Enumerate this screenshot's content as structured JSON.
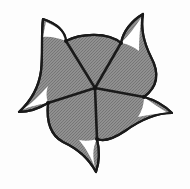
{
  "figure": {
    "type": "geometric-diagram",
    "background_color": "#fdfdfd",
    "fill_color": "#8a8a8a",
    "fill_pattern": "dithered-halftone",
    "outline_color": "#1a1a1a",
    "outline_width": 2.2,
    "spoke_color": "#1a1a1a",
    "spoke_width": 2.6,
    "highlight_color": "#ffffff",
    "symmetry_order": 5,
    "center": {
      "x": 95,
      "y": 88
    },
    "canvas": {
      "width": 190,
      "height": 189
    },
    "vertices": [
      {
        "name": "node-top-left",
        "x": 66,
        "y": 41
      },
      {
        "name": "node-top-right",
        "x": 121,
        "y": 43
      },
      {
        "name": "node-right",
        "x": 144,
        "y": 97
      },
      {
        "name": "node-bottom",
        "x": 97,
        "y": 139
      },
      {
        "name": "node-left",
        "x": 48,
        "y": 103
      }
    ],
    "horn_tips": [
      {
        "name": "horn-tip-top-left",
        "x": 43,
        "y": 19
      },
      {
        "name": "horn-tip-top-right",
        "x": 143,
        "y": 14
      },
      {
        "name": "horn-tip-right",
        "x": 172,
        "y": 113
      },
      {
        "name": "horn-tip-bottom",
        "x": 96,
        "y": 172
      },
      {
        "name": "horn-tip-left",
        "x": 19,
        "y": 112
      }
    ],
    "spokes": [
      {
        "name": "spoke-to-top-left",
        "from": "center",
        "to": "node-top-left"
      },
      {
        "name": "spoke-to-top-right",
        "from": "center",
        "to": "node-top-right"
      },
      {
        "name": "spoke-to-right",
        "from": "center",
        "to": "node-right"
      },
      {
        "name": "spoke-to-bottom",
        "from": "center",
        "to": "node-bottom"
      },
      {
        "name": "spoke-to-left",
        "from": "center",
        "to": "node-left"
      }
    ],
    "white_crescents": [
      {
        "name": "crescent-top-left"
      },
      {
        "name": "crescent-top-right"
      },
      {
        "name": "crescent-right"
      },
      {
        "name": "crescent-bottom"
      },
      {
        "name": "crescent-left"
      }
    ],
    "caption": ""
  }
}
